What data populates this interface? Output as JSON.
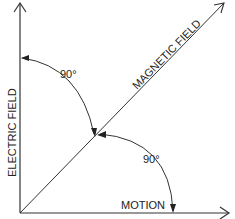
{
  "diagram": {
    "type": "vector-orientation",
    "labels": {
      "vertical_axis": "ELECTRIC FIELD",
      "diagonal_axis": "MAGNETIC FIELD",
      "horizontal_axis": "MOTION"
    },
    "angles": {
      "upper": "90°",
      "lower": "90°"
    },
    "colors": {
      "line": "#333333",
      "background": "#ffffff"
    }
  }
}
